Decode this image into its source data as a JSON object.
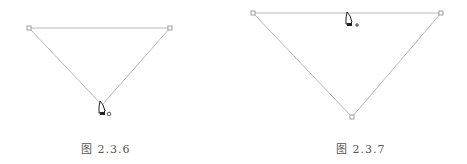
{
  "figures": [
    {
      "caption": "图 2.3.6",
      "points": [
        [
          29,
          28
        ],
        [
          170,
          28
        ],
        [
          102,
          105
        ]
      ],
      "cursor": {
        "x": 100,
        "y": 101,
        "modifier": "o",
        "icon": "pen-tool-close-path-icon"
      }
    },
    {
      "caption": "图 2.3.7",
      "points": [
        [
          253,
          13
        ],
        [
          441,
          13
        ],
        [
          352,
          117
        ]
      ],
      "cursor": {
        "x": 347,
        "y": 12,
        "modifier": "+",
        "icon": "pen-tool-add-anchor-icon"
      }
    }
  ],
  "colors": {
    "path": "#b8b8b8",
    "anchor": "#888888",
    "cursor": "#222222",
    "caption": "#555555"
  }
}
